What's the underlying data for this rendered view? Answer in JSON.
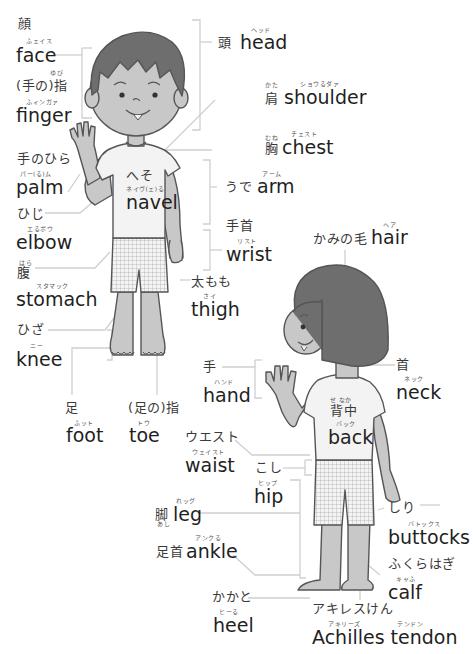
{
  "diagram": {
    "front_figure": {
      "labels": [
        {
          "id": "face",
          "jp": "顔",
          "ruby": "ふェイス",
          "en": "face"
        },
        {
          "id": "finger",
          "jp": "(手の)指",
          "jp_ruby": "ゆび",
          "ruby": "ふィンガァ",
          "en": "finger"
        },
        {
          "id": "palm",
          "jp": "手のひら",
          "ruby": "パー(る)ム",
          "en": "palm"
        },
        {
          "id": "elbow",
          "jp": "ひじ",
          "ruby": "エるボウ",
          "en": "elbow"
        },
        {
          "id": "stomach",
          "jp": "腹",
          "jp_ruby": "はら",
          "ruby": "スタマック",
          "en": "stomach"
        },
        {
          "id": "knee",
          "jp": "ひざ",
          "ruby": "ニー",
          "en": "knee"
        },
        {
          "id": "foot",
          "jp": "足",
          "ruby": "ふット",
          "en": "foot"
        },
        {
          "id": "toe",
          "jp": "(足の)指",
          "ruby": "トウ",
          "en": "toe"
        },
        {
          "id": "head",
          "jp": "頭",
          "ruby": "ヘッド",
          "en": "head"
        },
        {
          "id": "shoulder",
          "jp": "肩",
          "jp_ruby": "かた",
          "ruby": "ショウるダァ",
          "en": "shoulder"
        },
        {
          "id": "chest",
          "jp": "胸",
          "jp_ruby": "むね",
          "ruby": "チェスト",
          "en": "chest"
        },
        {
          "id": "navel",
          "jp": "へそ",
          "ruby": "ネイヴ(ェ)る",
          "en": "navel"
        },
        {
          "id": "arm",
          "jp": "うで",
          "ruby": "アーム",
          "en": "arm"
        },
        {
          "id": "wrist",
          "jp": "手首",
          "ruby": "リスト",
          "en": "wrist"
        },
        {
          "id": "thigh",
          "jp": "太もも",
          "ruby": "さイ",
          "en": "thigh"
        }
      ]
    },
    "back_figure": {
      "labels": [
        {
          "id": "hair",
          "jp": "かみの毛",
          "ruby": "ヘア",
          "en": "hair"
        },
        {
          "id": "neck",
          "jp": "首",
          "ruby": "ネック",
          "en": "neck"
        },
        {
          "id": "hand",
          "jp": "手",
          "ruby": "ハンド",
          "en": "hand"
        },
        {
          "id": "back",
          "jp": "背中",
          "jp_ruby": "せ なか",
          "ruby": "バック",
          "en": "back"
        },
        {
          "id": "waist",
          "jp": "ウエスト",
          "ruby": "ウェイスト",
          "en": "waist"
        },
        {
          "id": "hip",
          "jp": "こし",
          "ruby": "ヒップ",
          "en": "hip"
        },
        {
          "id": "leg",
          "jp": "脚",
          "jp_ruby": "あし",
          "ruby": "れッグ",
          "en": "leg"
        },
        {
          "id": "ankle",
          "jp": "足首",
          "ruby": "アンクる",
          "en": "ankle"
        },
        {
          "id": "heel",
          "jp": "かかと",
          "ruby": "ヒーる",
          "en": "heel"
        },
        {
          "id": "buttocks",
          "jp": "しり",
          "ruby": "バトックス",
          "en": "buttocks"
        },
        {
          "id": "calf",
          "jp": "ふくらはぎ",
          "ruby": "キャふ",
          "en": "calf"
        },
        {
          "id": "achilles",
          "jp": "アキレスけん",
          "ruby": "アキリーズ",
          "ruby2": "テンドン",
          "en": "Achilles tendon"
        }
      ]
    },
    "colors": {
      "skin": "#c8c8c8",
      "hair": "#6e6e6e",
      "shirt": "#f3f3f3",
      "outline": "#555555",
      "leader_line": "#cfcfcf",
      "text": "#1f1f1f"
    }
  }
}
